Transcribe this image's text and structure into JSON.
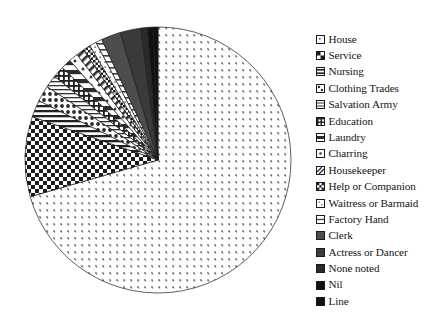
{
  "chart_data": {
    "type": "pie",
    "title": "",
    "xlabel": "",
    "ylabel": "",
    "legend_position": "right",
    "grid": false,
    "units": "degrees of arc (proportional share)",
    "start_angle_deg": 0,
    "direction": "clockwise",
    "categories": [
      "House",
      "Service",
      "Nursing",
      "Clothing Trades",
      "Salvation Army",
      "Education",
      "Laundry",
      "Charring",
      "Housekeeper",
      "Help or Companion",
      "Waitress or Barmaid",
      "Factory Hand",
      "Clerk",
      "Actress or Dancer",
      "None noted",
      "Nil",
      "Line"
    ],
    "slices": [
      {
        "label": "House",
        "angle_deg": 254.0,
        "pattern": "sparse-speckle",
        "fill": "#ffffff",
        "ink": "#555555"
      },
      {
        "label": "Service",
        "angle_deg": 35.0,
        "pattern": "bold-checkerboard",
        "fill": "#ffffff",
        "ink": "#1b1b1b"
      },
      {
        "label": "Nursing",
        "angle_deg": 7.5,
        "pattern": "horizontal-lines",
        "fill": "#ffffff",
        "ink": "#222222"
      },
      {
        "label": "Clothing Trades",
        "angle_deg": 7.0,
        "pattern": "medium-dots",
        "fill": "#ffffff",
        "ink": "#2a2a2a"
      },
      {
        "label": "Salvation Army",
        "angle_deg": 5.5,
        "pattern": "fine-horizontal",
        "fill": "#ffffff",
        "ink": "#333333"
      },
      {
        "label": "Education",
        "angle_deg": 5.0,
        "pattern": "dense-grid",
        "fill": "#ffffff",
        "ink": "#1f1f1f"
      },
      {
        "label": "Laundry",
        "angle_deg": 4.5,
        "pattern": "wide-stripes",
        "fill": "#ffffff",
        "ink": "#2b2b2b"
      },
      {
        "label": "Charring",
        "angle_deg": 4.0,
        "pattern": "sparse-dots",
        "fill": "#ffffff",
        "ink": "#3a3a3a"
      },
      {
        "label": "Housekeeper",
        "angle_deg": 3.5,
        "pattern": "diagonal-hatch",
        "fill": "#ffffff",
        "ink": "#2e2e2e"
      },
      {
        "label": "Help or Companion",
        "angle_deg": 3.2,
        "pattern": "checker-small",
        "fill": "#ffffff",
        "ink": "#1c1c1c"
      },
      {
        "label": "Waitress or Barmaid",
        "angle_deg": 3.0,
        "pattern": "fine-speckle",
        "fill": "#ffffff",
        "ink": "#4a4a4a"
      },
      {
        "label": "Factory Hand",
        "angle_deg": 2.8,
        "pattern": "light-horizontal",
        "fill": "#ffffff",
        "ink": "#3f3f3f"
      },
      {
        "label": "Clerk",
        "angle_deg": 8.5,
        "pattern": "solid-mid-grey",
        "fill": "#4d4d4d",
        "ink": "#4d4d4d"
      },
      {
        "label": "Actress or Dancer",
        "angle_deg": 9.0,
        "pattern": "solid-dark-grey",
        "fill": "#3a3a3a",
        "ink": "#3a3a3a"
      },
      {
        "label": "None noted",
        "angle_deg": 3.0,
        "pattern": "solid-charcoal",
        "fill": "#2a2a2a",
        "ink": "#2a2a2a"
      },
      {
        "label": "Nil",
        "angle_deg": 2.5,
        "pattern": "solid-black",
        "fill": "#141414",
        "ink": "#141414"
      },
      {
        "label": "Line",
        "angle_deg": 2.0,
        "pattern": "solid-black",
        "fill": "#000000",
        "ink": "#000000"
      }
    ]
  },
  "legend": {
    "items": [
      {
        "label": "House",
        "swatch": "sparse-speckle"
      },
      {
        "label": "Service",
        "swatch": "bold-checkerboard"
      },
      {
        "label": "Nursing",
        "swatch": "horizontal-lines"
      },
      {
        "label": "Clothing Trades",
        "swatch": "medium-dots"
      },
      {
        "label": "Salvation Army",
        "swatch": "fine-horizontal"
      },
      {
        "label": "Education",
        "swatch": "dense-grid"
      },
      {
        "label": "Laundry",
        "swatch": "wide-stripes"
      },
      {
        "label": "Charring",
        "swatch": "sparse-dots"
      },
      {
        "label": "Housekeeper",
        "swatch": "diagonal-hatch"
      },
      {
        "label": "Help or Companion",
        "swatch": "checker-small"
      },
      {
        "label": "Waitress or Barmaid",
        "swatch": "fine-speckle"
      },
      {
        "label": "Factory Hand",
        "swatch": "light-horizontal"
      },
      {
        "label": "Clerk",
        "swatch": "solid-mid-grey"
      },
      {
        "label": "Actress or Dancer",
        "swatch": "solid-dark-grey"
      },
      {
        "label": "None noted",
        "swatch": "solid-charcoal"
      },
      {
        "label": "Nil",
        "swatch": "solid-black"
      },
      {
        "label": "Line",
        "swatch": "solid-black"
      }
    ]
  },
  "colors": {
    "background": "#ffffff",
    "ink": "#111111",
    "outline": "#1a1a1a"
  }
}
